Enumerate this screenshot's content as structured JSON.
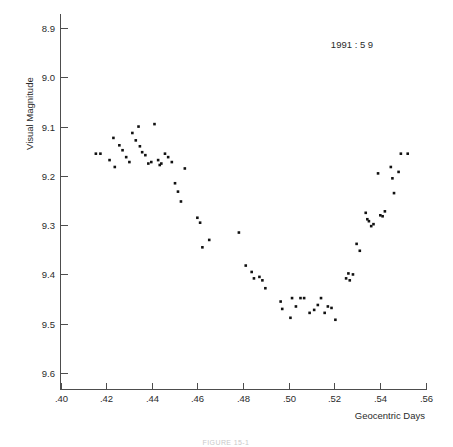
{
  "figure": {
    "annotation": "1991 : 5 9",
    "caption": "FIGURE 15-1"
  },
  "chart_data": {
    "type": "scatter",
    "title": "",
    "subtitle": "",
    "annotation": "1991 : 5 9",
    "xlabel": "Geocentric Days",
    "ylabel": "Visual Magnitude",
    "xlim": [
      0.4,
      0.56
    ],
    "ylim": [
      8.9,
      9.6
    ],
    "y_inverted": true,
    "grid": false,
    "legend": null,
    "xticks": [
      0.4,
      0.42,
      0.44,
      0.46,
      0.48,
      0.5,
      0.52,
      0.54,
      0.56
    ],
    "xticklabels": [
      ".40",
      ".42",
      ".44",
      ".46",
      ".48",
      ".50",
      ".52",
      ".54",
      ".56"
    ],
    "yticks": [
      8.9,
      9.0,
      9.1,
      9.2,
      9.3,
      9.4,
      9.5,
      9.6
    ],
    "yticklabels": [
      "8.9",
      "9.0",
      "9.1",
      "9.2",
      "9.3",
      "9.4",
      "9.5",
      "9.6"
    ],
    "marker": "filled-square",
    "marker_color": "#111111",
    "n_points": 75,
    "x": [
      0.4155,
      0.4175,
      0.4215,
      0.4232,
      0.4238,
      0.4258,
      0.4272,
      0.4288,
      0.4302,
      0.4315,
      0.433,
      0.4342,
      0.4348,
      0.4358,
      0.4372,
      0.4385,
      0.4398,
      0.4412,
      0.4428,
      0.4435,
      0.4442,
      0.4458,
      0.4472,
      0.4488,
      0.4502,
      0.4515,
      0.4528,
      0.4545,
      0.46,
      0.4612,
      0.4622,
      0.4652,
      0.4782,
      0.4812,
      0.4838,
      0.4848,
      0.4872,
      0.4885,
      0.4898,
      0.4965,
      0.4972,
      0.5008,
      0.5015,
      0.5032,
      0.5052,
      0.5068,
      0.5092,
      0.5112,
      0.5128,
      0.5142,
      0.5158,
      0.5172,
      0.5188,
      0.5205,
      0.5252,
      0.5262,
      0.5268,
      0.5282,
      0.5298,
      0.5312,
      0.5338,
      0.5345,
      0.5352,
      0.5362,
      0.5372,
      0.5392,
      0.5402,
      0.5412,
      0.5422,
      0.5448,
      0.5455,
      0.5462,
      0.5482,
      0.5492,
      0.5522
    ],
    "y": [
      9.155,
      9.155,
      9.168,
      9.123,
      9.182,
      9.138,
      9.148,
      9.162,
      9.172,
      9.113,
      9.128,
      9.1,
      9.14,
      9.152,
      9.158,
      9.175,
      9.172,
      9.095,
      9.168,
      9.178,
      9.175,
      9.155,
      9.162,
      9.172,
      9.215,
      9.232,
      9.252,
      9.185,
      9.285,
      9.295,
      9.345,
      9.33,
      9.315,
      9.382,
      9.395,
      9.408,
      9.405,
      9.412,
      9.428,
      9.455,
      9.47,
      9.488,
      9.448,
      9.465,
      9.448,
      9.448,
      9.478,
      9.472,
      9.462,
      9.448,
      9.478,
      9.465,
      9.468,
      9.492,
      9.408,
      9.398,
      9.412,
      9.4,
      9.338,
      9.352,
      9.275,
      9.288,
      9.292,
      9.302,
      9.298,
      9.195,
      9.28,
      9.282,
      9.272,
      9.182,
      9.205,
      9.235,
      9.192,
      9.155,
      9.155
    ]
  }
}
